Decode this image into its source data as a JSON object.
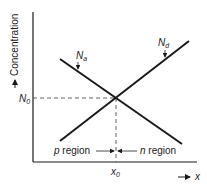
{
  "diagram": {
    "type": "pn-junction-concentration-profile",
    "y_axis": {
      "label": "Concentration",
      "arrow": "up-arrow"
    },
    "x_axis": {
      "label": "x",
      "arrow": "right-arrow"
    },
    "curves": [
      {
        "name": "Na",
        "label_main": "N",
        "label_sub": "a",
        "slope": "decreasing",
        "from": [
          60,
          59
        ],
        "to": [
          182,
          144
        ]
      },
      {
        "name": "Nd",
        "label_main": "N",
        "label_sub": "d",
        "slope": "increasing",
        "from": [
          60,
          141
        ],
        "to": [
          189,
          41
        ]
      }
    ],
    "intersection": {
      "x_label_main": "x",
      "x_label_sub": "0",
      "y_label_main": "N",
      "y_label_sub": "0"
    },
    "regions": {
      "left": {
        "italic": "p",
        "text": " region"
      },
      "right": {
        "italic": "n",
        "text": " region"
      }
    },
    "colors": {
      "line": "#1a1a1a",
      "dashed": "#555555",
      "background": "#ffffff"
    }
  }
}
